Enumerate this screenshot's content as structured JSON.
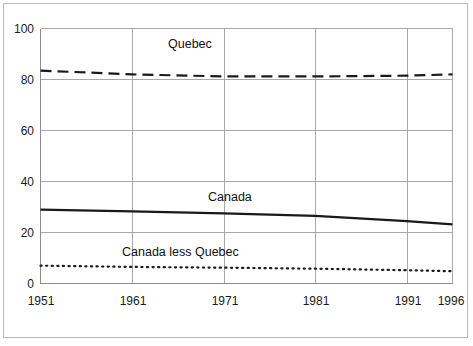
{
  "chart_data": {
    "type": "line",
    "title": "",
    "xlabel": "",
    "ylabel": "",
    "x": [
      1951,
      1961,
      1971,
      1981,
      1991,
      1996
    ],
    "xlim": [
      1951,
      1996
    ],
    "ylim": [
      0,
      100
    ],
    "ytick_labels": [
      "0",
      "20",
      "40",
      "60",
      "80",
      "100"
    ],
    "yticks": [
      0,
      20,
      40,
      60,
      80,
      100
    ],
    "xtick_labels": [
      "1951",
      "1961",
      "1971",
      "1981",
      "1991",
      "1996"
    ],
    "grid": "both",
    "legend_position": "inline-annotations",
    "series": [
      {
        "name": "Quebec",
        "style": "dashed",
        "color": "#1a1a1a",
        "values": [
          83.5,
          82.0,
          81.2,
          81.2,
          81.5,
          82.0
        ],
        "label_x": 1971,
        "label_y": 91
      },
      {
        "name": "Canada",
        "style": "solid",
        "color": "#1a1a1a",
        "values": [
          29.0,
          28.3,
          27.5,
          26.5,
          24.5,
          23.2
        ],
        "label_x": 1974,
        "label_y": 36
      },
      {
        "name": "Canada less Quebec",
        "style": "dotted",
        "color": "#1a1a1a",
        "values": [
          7.0,
          6.5,
          6.2,
          5.8,
          5.2,
          4.8
        ],
        "label_x": 1966,
        "label_y": 13
      }
    ],
    "colors": {
      "gridline": "#a8a8a8",
      "axis": "#8c8c8c",
      "frame": "#b9b9b9",
      "text": "#1a1a1a"
    }
  },
  "axis": {
    "y_labels": [
      "100",
      "80",
      "60",
      "40",
      "20",
      "0"
    ],
    "x_labels": [
      "1951",
      "1961",
      "1971",
      "1981",
      "1991",
      "1996"
    ]
  },
  "annotations": {
    "quebec": "Quebec",
    "canada": "Canada",
    "canada_less_quebec": "Canada less Quebec"
  }
}
